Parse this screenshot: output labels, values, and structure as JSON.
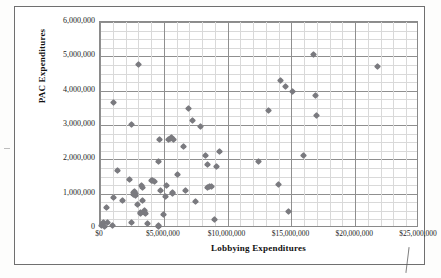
{
  "chart_data": {
    "type": "scatter",
    "title": "",
    "xlabel": "Lobbying Expenditures",
    "ylabel": "PAC Expenditures",
    "xlim": [
      0,
      25000000
    ],
    "ylim": [
      0,
      6000000
    ],
    "xticks": [
      0,
      5000000,
      10000000,
      15000000,
      20000000,
      25000000
    ],
    "xtick_labels": [
      "$0",
      "$5,000,000",
      "$10,000,000",
      "$15,000,000",
      "$20,000,000",
      "$25,000,000"
    ],
    "yticks": [
      0,
      1000000,
      2000000,
      3000000,
      4000000,
      5000000,
      6000000
    ],
    "ytick_labels": [
      "0",
      "1,000,000",
      "2,000,000",
      "3,000,000",
      "4,000,000",
      "5,000,000",
      "6,000,000"
    ],
    "grid": true,
    "grid_major_y_step": 1000000,
    "grid_minor_y_step": 250000,
    "grid_major_x_step": 5000000,
    "grid_minor_x_step": 1000000,
    "legend": null,
    "marker": "diamond",
    "marker_color": "#7a7a7f",
    "series": [
      {
        "name": "Organizations",
        "points": [
          [
            120000,
            60000
          ],
          [
            180000,
            120000
          ],
          [
            250000,
            170000
          ],
          [
            330000,
            30000
          ],
          [
            520000,
            600000
          ],
          [
            620000,
            150000
          ],
          [
            1000000,
            70000
          ],
          [
            1050000,
            880000
          ],
          [
            1080000,
            3660000
          ],
          [
            1350000,
            1670000
          ],
          [
            1800000,
            790000
          ],
          [
            2350000,
            1410000
          ],
          [
            2450000,
            3010000
          ],
          [
            2500000,
            170000
          ],
          [
            2600000,
            1030000
          ],
          [
            2650000,
            990000
          ],
          [
            2700000,
            1060000
          ],
          [
            2750000,
            1000000
          ],
          [
            2800000,
            950000
          ],
          [
            2900000,
            690000
          ],
          [
            3050000,
            4760000
          ],
          [
            3150000,
            460000
          ],
          [
            3200000,
            430000
          ],
          [
            3250000,
            1230000
          ],
          [
            3300000,
            1190000
          ],
          [
            3350000,
            790000
          ],
          [
            3450000,
            500000
          ],
          [
            3500000,
            440000
          ],
          [
            3600000,
            410000
          ],
          [
            3750000,
            140000
          ],
          [
            4050000,
            1390000
          ],
          [
            4150000,
            1370000
          ],
          [
            4300000,
            1360000
          ],
          [
            4550000,
            40000
          ],
          [
            4600000,
            60000
          ],
          [
            4620000,
            1950000
          ],
          [
            4700000,
            2580000
          ],
          [
            4750000,
            1080000
          ],
          [
            4950000,
            390000
          ],
          [
            5100000,
            930000
          ],
          [
            5250000,
            1250000
          ],
          [
            5350000,
            2590000
          ],
          [
            5500000,
            2610000
          ],
          [
            5600000,
            2640000
          ],
          [
            5650000,
            1020000
          ],
          [
            5700000,
            1010000
          ],
          [
            5750000,
            2590000
          ],
          [
            6100000,
            1570000
          ],
          [
            6550000,
            2370000
          ],
          [
            6700000,
            1080000
          ],
          [
            6950000,
            3490000
          ],
          [
            7250000,
            3140000
          ],
          [
            7450000,
            770000
          ],
          [
            7850000,
            2960000
          ],
          [
            8300000,
            2120000
          ],
          [
            8400000,
            1840000
          ],
          [
            8450000,
            1180000
          ],
          [
            8550000,
            1200000
          ],
          [
            8700000,
            1220000
          ],
          [
            9000000,
            250000
          ],
          [
            9150000,
            1790000
          ],
          [
            9350000,
            2220000
          ],
          [
            12400000,
            1950000
          ],
          [
            13200000,
            3420000
          ],
          [
            13950000,
            1260000
          ],
          [
            14150000,
            4290000
          ],
          [
            14550000,
            4120000
          ],
          [
            14750000,
            490000
          ],
          [
            15050000,
            3990000
          ],
          [
            15950000,
            2110000
          ],
          [
            16750000,
            5040000
          ],
          [
            16900000,
            3860000
          ],
          [
            16950000,
            3280000
          ],
          [
            21750000,
            4700000
          ]
        ]
      }
    ]
  }
}
